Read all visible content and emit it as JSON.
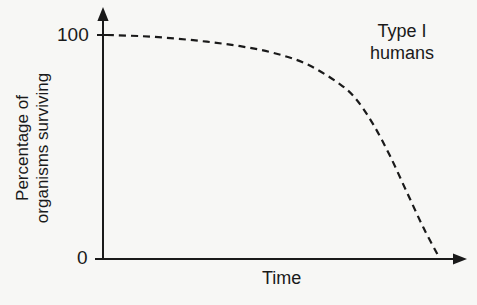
{
  "chart_data": {
    "type": "line",
    "title": "",
    "xlabel": "Time",
    "ylabel": "Percentage of organisms surviving",
    "ylabel_lines": [
      "Percentage of",
      "organisms surviving"
    ],
    "y_ticks": [
      "100",
      "0"
    ],
    "ylim": [
      0,
      100
    ],
    "x_ticks": [],
    "grid": false,
    "legend": null,
    "annotation": {
      "lines": [
        "Type I",
        "humans"
      ]
    },
    "series": [
      {
        "name": "Type I (humans)",
        "style": "dashed",
        "x": [
          0,
          10,
          20,
          30,
          40,
          50,
          60,
          70,
          75,
          80,
          85,
          90,
          95,
          100
        ],
        "values": [
          100,
          99.5,
          98.5,
          97,
          95,
          92,
          87,
          78,
          71,
          60,
          46,
          30,
          14,
          0
        ]
      }
    ]
  },
  "labels": {
    "y_top": "100",
    "y_bottom": "0",
    "x_axis": "Time",
    "y_axis_line1": "Percentage of",
    "y_axis_line2": "organisms surviving",
    "annotation_line1": "Type I",
    "annotation_line2": "humans"
  }
}
